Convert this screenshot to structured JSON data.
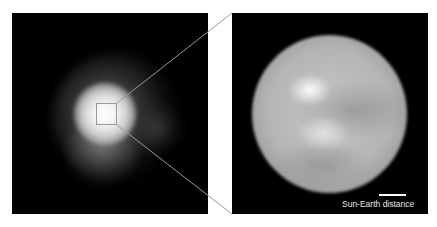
{
  "figure": {
    "left_panel": {
      "description": "Wide-field view of a star with fuzzy extended glow; small square marks zoomed region"
    },
    "right_panel": {
      "description": "Zoomed-in resolved stellar disk showing bright and dark surface features",
      "scale_bar": {
        "label": "Sun-Earth distance"
      }
    },
    "colors": {
      "background": "#ffffff",
      "panel_background": "#000000",
      "connector_lines": "#9a9a9a"
    }
  }
}
